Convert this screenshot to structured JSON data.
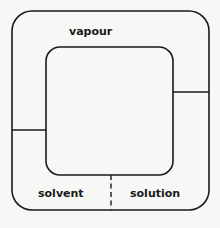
{
  "diagram": {
    "labels": {
      "vapour": "vapour",
      "solvent": "solvent",
      "solution": "solution"
    },
    "colors": {
      "background": "#f7f7f5",
      "stroke": "#1a1a1a"
    },
    "regions": [
      {
        "name": "vapour",
        "position": "top ring"
      },
      {
        "name": "solvent",
        "position": "bottom-left ring"
      },
      {
        "name": "solution",
        "position": "bottom-right ring"
      }
    ],
    "dividers": [
      {
        "side": "left",
        "style": "solid"
      },
      {
        "side": "right",
        "style": "solid"
      },
      {
        "side": "bottom",
        "style": "dashed"
      }
    ]
  }
}
